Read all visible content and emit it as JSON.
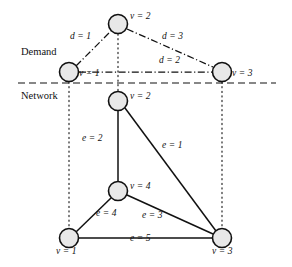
{
  "figure": {
    "width": 292,
    "height": 267,
    "background": "#ffffff",
    "ink_color": "#111111",
    "node_fill": "#e8e8e8",
    "node_stroke": "#111111"
  },
  "sections": {
    "demand_label": "Demand",
    "network_label": "Network"
  },
  "demand_layer": {
    "nodes": [
      {
        "id": "d2",
        "label": "v = 2",
        "x": 118,
        "y": 24,
        "r": 9.5,
        "label_x": 130,
        "label_y": 16
      },
      {
        "id": "d1",
        "label": "v = 1",
        "x": 69,
        "y": 72,
        "r": 9.5,
        "label_x": 80,
        "label_y": 73
      },
      {
        "id": "d3",
        "label": "v = 3",
        "x": 222,
        "y": 72,
        "r": 9.5,
        "label_x": 233,
        "label_y": 73
      }
    ],
    "edges": [
      {
        "id": "d_1",
        "label": "d = 1",
        "from": "d1",
        "to": "d2",
        "label_x": 71,
        "label_y": 36
      },
      {
        "id": "d_3",
        "label": "d = 3",
        "from": "d2",
        "to": "d3",
        "label_x": 163,
        "label_y": 36
      },
      {
        "id": "d_2",
        "label": "d = 2",
        "from": "d1",
        "to": "d3",
        "label_x": 160,
        "label_y": 60
      }
    ]
  },
  "network_layer": {
    "nodes": [
      {
        "id": "n2",
        "label": "v = 2",
        "x": 118,
        "y": 101,
        "r": 9.5,
        "label_x": 130,
        "label_y": 96
      },
      {
        "id": "n4",
        "label": "v = 4",
        "x": 118,
        "y": 191,
        "r": 9.5,
        "label_x": 130,
        "label_y": 186
      },
      {
        "id": "n1",
        "label": "v = 1",
        "x": 69,
        "y": 238,
        "r": 9.5,
        "label_x": 58,
        "label_y": 250
      },
      {
        "id": "n3",
        "label": "v = 3",
        "x": 222,
        "y": 238,
        "r": 9.5,
        "label_x": 215,
        "label_y": 250
      }
    ],
    "edges": [
      {
        "id": "e_2",
        "label": "e = 2",
        "from": "n2",
        "to": "n4",
        "label_x": 83,
        "label_y": 138
      },
      {
        "id": "e_1",
        "label": "e = 1",
        "from": "n2",
        "to": "n3",
        "label_x": 163,
        "label_y": 145
      },
      {
        "id": "e_4",
        "label": "e = 4",
        "from": "n1",
        "to": "n4",
        "label_x": 97,
        "label_y": 213
      },
      {
        "id": "e_3",
        "label": "e = 3",
        "from": "n4",
        "to": "n3",
        "label_x": 143,
        "label_y": 215
      },
      {
        "id": "e_5",
        "label": "e = 5",
        "from": "n1",
        "to": "n3",
        "label_x": 131,
        "label_y": 238
      }
    ]
  },
  "mapping_lines": [
    {
      "id": "map-v1",
      "x": 69,
      "y1": 82,
      "y2": 229
    },
    {
      "id": "map-v2",
      "x": 118,
      "y1": 34,
      "y2": 91
    },
    {
      "id": "map-v3",
      "x": 222,
      "y1": 82,
      "y2": 229
    }
  ],
  "separator": {
    "id": "layer-separator",
    "x1": 18,
    "x2": 276,
    "y": 83
  },
  "section_label_positions": {
    "demand": {
      "x": 21,
      "y": 52
    },
    "network": {
      "x": 21,
      "y": 96
    }
  }
}
